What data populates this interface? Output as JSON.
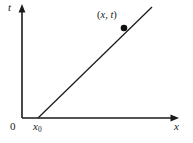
{
  "figure": {
    "background_color": "#ffffff",
    "stroke_color": "#1a1a1a",
    "axes": {
      "vertical": {
        "name": "t-axis",
        "label": "t",
        "arrow": "up",
        "x": 22,
        "y_top": 6,
        "y_bottom": 118
      },
      "horizontal": {
        "name": "x-axis",
        "label": "x",
        "arrow": "right",
        "y": 118,
        "x_left": 22,
        "x_right": 178
      }
    },
    "origin_label": "0",
    "intercept_label_base": "x",
    "intercept_label_sub": "0",
    "intercept": {
      "x": 38,
      "y": 118
    },
    "worldline": {
      "name": "worldline",
      "x1": 38,
      "y1": 118,
      "x2": 152,
      "y2": 7
    },
    "point": {
      "name": "event-point",
      "x": 124,
      "y": 28,
      "radius": 3.2,
      "label_open": "(",
      "label_x": "x",
      "label_comma": ", ",
      "label_t": "t",
      "label_close": ")"
    }
  }
}
